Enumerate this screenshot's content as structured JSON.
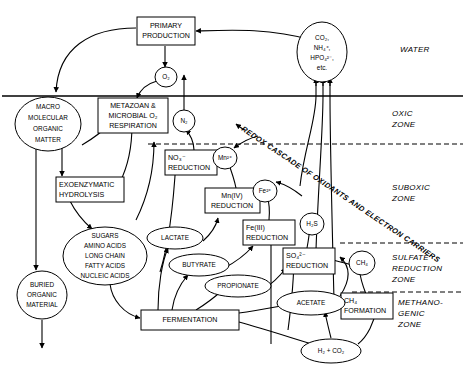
{
  "figure": {
    "type": "flow-diagram"
  },
  "zones": [
    {
      "id": "water",
      "label_lines": [
        "WATER"
      ]
    },
    {
      "id": "oxic",
      "label_lines": [
        "OXIC",
        "ZONE"
      ]
    },
    {
      "id": "suboxic",
      "label_lines": [
        "SUBOXIC",
        "ZONE"
      ]
    },
    {
      "id": "sulfate",
      "label_lines": [
        "SULFATE",
        "REDUCTION",
        "ZONE"
      ]
    },
    {
      "id": "methanogenic",
      "label_lines": [
        "METHANO-",
        "GENIC",
        "ZONE"
      ]
    }
  ],
  "cascade_label": "REDOX CASCADE OF OXIDANTS AND ELECTRON CARRIERS",
  "boxes": [
    {
      "id": "primary-production",
      "lines": [
        "PRIMARY",
        "PRODUCTION"
      ]
    },
    {
      "id": "metazoan-respiration",
      "lines": [
        "METAZOAN &",
        "MICROBIAL O₂",
        "RESPIRATION"
      ]
    },
    {
      "id": "exoenzymatic-hydrolysis",
      "lines": [
        "EXOENZYMATIC",
        "HYDROLYSIS"
      ]
    },
    {
      "id": "no3-reduction",
      "lines": [
        "NO₃⁻",
        "REDUCTION"
      ]
    },
    {
      "id": "mn4-reduction",
      "lines": [
        "Mn(IV)",
        "REDUCTION"
      ]
    },
    {
      "id": "fe3-reduction",
      "lines": [
        "Fe(III)",
        "REDUCTION"
      ]
    },
    {
      "id": "so4-reduction",
      "lines": [
        "SO₄²⁻",
        "REDUCTION"
      ]
    },
    {
      "id": "ch4-formation",
      "lines": [
        "CH₄",
        "FORMATION"
      ]
    },
    {
      "id": "fermentation",
      "lines": [
        "FERMENTATION"
      ]
    }
  ],
  "ellipses": [
    {
      "id": "co2-nutrients",
      "lines": [
        "CO₂,",
        "NH₄⁺,",
        "HPO₄²⁻,",
        "etc."
      ]
    },
    {
      "id": "o2",
      "lines": [
        "O₂"
      ]
    },
    {
      "id": "macro-organic-matter",
      "lines": [
        "MACRO",
        "MOLECULAR",
        "ORGANIC",
        "MATTER"
      ]
    },
    {
      "id": "n2",
      "lines": [
        "N₂"
      ]
    },
    {
      "id": "mn2plus",
      "lines": [
        "Mn²⁺"
      ]
    },
    {
      "id": "fe2plus",
      "lines": [
        "Fe²⁺"
      ]
    },
    {
      "id": "h2s",
      "lines": [
        "H₂S"
      ]
    },
    {
      "id": "ch4",
      "lines": [
        "CH₄"
      ]
    },
    {
      "id": "monomers",
      "lines": [
        "SUGARS",
        "AMINO ACIDS",
        "LONG CHAIN",
        "FATTY ACIDS",
        "NUCLEIC ACIDS"
      ]
    },
    {
      "id": "buried-organic-material",
      "lines": [
        "BURIED",
        "ORGANIC",
        "MATERIAL"
      ]
    },
    {
      "id": "lactate",
      "lines": [
        "LACTATE"
      ]
    },
    {
      "id": "butyrate",
      "lines": [
        "BUTYRATE"
      ]
    },
    {
      "id": "propionate",
      "lines": [
        "PROPIONATE"
      ]
    },
    {
      "id": "acetate",
      "lines": [
        "ACETATE"
      ]
    },
    {
      "id": "h2-co2",
      "lines": [
        "H₂ + CO₂"
      ]
    }
  ],
  "colors": {
    "stroke": "#000000",
    "fill": "#ffffff",
    "background": "#ffffff"
  }
}
